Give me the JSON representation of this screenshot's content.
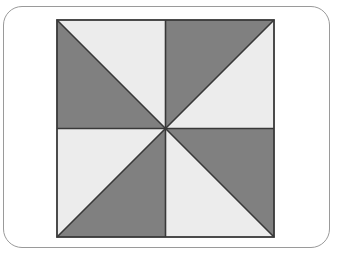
{
  "figure": {
    "description": "A square divided into four equal quadrants, each quadrant split by a diagonal into two right triangles shaded light gray and dark gray to form a pinwheel pattern.",
    "shape": "square",
    "quadrant_count": 4,
    "triangle_count": 8,
    "dark_triangle_count": 4,
    "light_triangle_count": 4,
    "fraction_shaded_dark": "1/2",
    "colors": {
      "dark": "#808080",
      "light": "#ececec",
      "outline": "#383838",
      "frame": "#9a9a9a",
      "background": "#ffffff"
    },
    "geometry": {
      "square_size": 218,
      "center_x": 109,
      "center_y": 109
    },
    "triangles": [
      {
        "name": "top-left-dark",
        "quadrant": "top-left",
        "shade": "dark",
        "points": "0,0 0,109 109,109"
      },
      {
        "name": "top-left-light",
        "quadrant": "top-left",
        "shade": "light",
        "points": "0,0 109,0 109,109"
      },
      {
        "name": "top-right-dark",
        "quadrant": "top-right",
        "shade": "dark",
        "points": "109,0 218,0 109,109"
      },
      {
        "name": "top-right-light",
        "quadrant": "top-right",
        "shade": "light",
        "points": "218,0 218,109 109,109"
      },
      {
        "name": "bottom-left-light",
        "quadrant": "bottom-left",
        "shade": "light",
        "points": "0,109 109,109 0,218"
      },
      {
        "name": "bottom-left-dark",
        "quadrant": "bottom-left",
        "shade": "dark",
        "points": "109,109 218,218 0,218"
      },
      {
        "name": "bottom-right-dark",
        "quadrant": "bottom-right",
        "shade": "dark",
        "points": "109,109 218,109 218,218"
      },
      {
        "name": "bottom-right-light",
        "quadrant": "bottom-right",
        "shade": "light",
        "points": "109,109 109,218 218,218"
      }
    ],
    "divider_lines": [
      {
        "name": "horizontal-midline",
        "x1": 0,
        "y1": 109,
        "x2": 218,
        "y2": 109
      },
      {
        "name": "vertical-midline",
        "x1": 109,
        "y1": 0,
        "x2": 109,
        "y2": 218
      },
      {
        "name": "diagonal-top-left-to-bottom-right",
        "x1": 0,
        "y1": 0,
        "x2": 218,
        "y2": 218
      },
      {
        "name": "diagonal-top-right-to-bottom-left",
        "x1": 218,
        "y1": 0,
        "x2": 0,
        "y2": 218
      }
    ]
  }
}
